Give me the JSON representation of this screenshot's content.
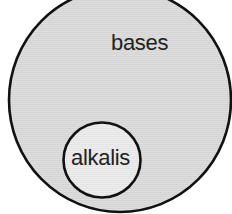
{
  "diagram": {
    "type": "venn-subset",
    "outer_set": {
      "label": "bases",
      "fill": "#dcdcdc",
      "stroke": "#111111"
    },
    "inner_set": {
      "label": "alkalis",
      "fill": "#ebebeb",
      "stroke": "#111111"
    }
  }
}
